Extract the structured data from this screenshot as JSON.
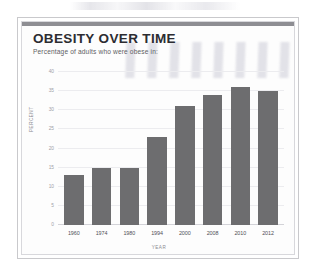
{
  "card": {
    "title": "OBESITY OVER TIME",
    "subtitle": "Percentage of adults who were obese in:"
  },
  "chart_data": {
    "type": "bar",
    "title": "OBESITY OVER TIME",
    "subtitle": "Percentage of adults who were obese in:",
    "xlabel": "YEAR",
    "ylabel": "PERCENT",
    "categories": [
      "1960",
      "1974",
      "1980",
      "1994",
      "2000",
      "2008",
      "2010",
      "2012"
    ],
    "values": [
      13,
      15,
      15,
      23,
      31,
      34,
      36,
      35
    ],
    "ylim": [
      0,
      40
    ],
    "yticks": [
      40,
      35,
      30,
      25,
      20,
      15,
      10,
      5,
      0
    ],
    "grid": true,
    "legend": false,
    "bar_color": "#6d6d6f"
  }
}
